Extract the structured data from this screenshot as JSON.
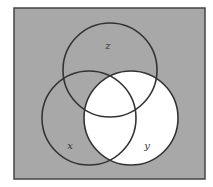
{
  "diagram": {
    "type": "venn-3-set",
    "universe": {
      "x": 14,
      "y": 8,
      "width": 191,
      "height": 171,
      "fill": "#a8a8a8",
      "stroke": "#444444"
    },
    "sets": [
      {
        "name": "z",
        "label": "z",
        "cx": 110,
        "cy": 70,
        "r": 47,
        "label_x": 108,
        "label_y": 49
      },
      {
        "name": "x",
        "label": "x",
        "cx": 89,
        "cy": 118,
        "r": 47,
        "label_x": 70,
        "label_y": 149
      },
      {
        "name": "y",
        "label": "y",
        "cx": 131,
        "cy": 118,
        "r": 47,
        "label_x": 147,
        "label_y": 149
      }
    ],
    "shaded_color": "#a8a8a8",
    "unshaded_color": "#ffffff",
    "unshaded_region": "y",
    "stroke_color": "#333333"
  }
}
